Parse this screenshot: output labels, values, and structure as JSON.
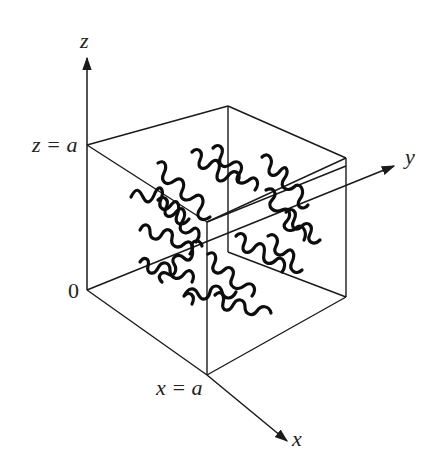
{
  "figure": {
    "colors": {
      "line": "#1a1a1a",
      "chain": "#0d0d0d",
      "background": "#ffffff"
    }
  },
  "labels": {
    "z_axis": "z",
    "y_axis": "y",
    "x_axis": "x",
    "z_eq_a": "z = a",
    "x_eq_a": "x = a",
    "origin": "0"
  },
  "geometry": {
    "origin": [
      87,
      290
    ],
    "z_top": [
      87,
      145
    ],
    "back_top": [
      228,
      106
    ],
    "right_top": [
      346,
      158
    ],
    "front_top": [
      207,
      222
    ],
    "back_bottom": [
      228,
      252
    ],
    "right_bottom": [
      346,
      297
    ],
    "front_bottom": [
      207,
      375
    ],
    "z_axis_tip": [
      87,
      57
    ],
    "y_axis_tip": [
      395,
      166
    ],
    "x_axis_tip": [
      288,
      442
    ]
  }
}
